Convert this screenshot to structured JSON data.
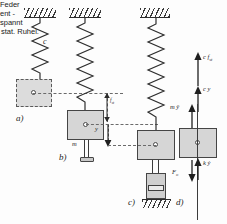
{
  "figure": {
    "panels": [
      {
        "id": "a",
        "label": "a)"
      },
      {
        "id": "b",
        "label": "b)"
      },
      {
        "id": "c",
        "label": "c)"
      },
      {
        "id": "d",
        "label": "d)"
      }
    ]
  },
  "annotations": {
    "spring_constant": "c",
    "mass": "m",
    "spring_relaxed_line1": "Feder",
    "spring_relaxed_line2": "ent -",
    "spring_relaxed_line3": "spannt",
    "static_rest": "stat. Ruhel.",
    "static_deflection": "f",
    "static_deflection_sub": "st",
    "displacement": "y"
  },
  "forces": {
    "spring_static": "c f",
    "spring_static_sub": "st",
    "spring_dynamic": "c y",
    "inertia": "m ÿ",
    "damper": "k ẏ",
    "excitation": "F",
    "excitation_sub": "o"
  },
  "colors": {
    "block_fill": "#d6d6d6",
    "block_stroke": "#454545",
    "line": "#3c3c3c",
    "hatch": "#3a3a3a",
    "dashed": "#6a6a6a",
    "text": "#1d1d1d",
    "background": "#fdfdfd"
  }
}
